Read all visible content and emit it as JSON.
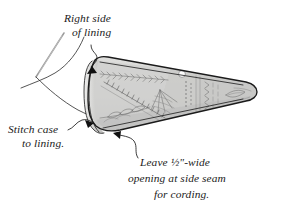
{
  "figure": {
    "background_color": "#ffffff",
    "ink_color": "#1b1b1b",
    "fabric_fill": "#d8d8d6",
    "fabric_shade": "#c2c2c0",
    "stitch_color": "#6f6f6f"
  },
  "annotations": [
    {
      "id": "right-side-of-lining",
      "line1": "Right side",
      "line2": "of lining",
      "x": 64,
      "y": 20,
      "points_to": "left folded edge of case"
    },
    {
      "id": "stitch-case-to-lining",
      "line1": "Stitch case",
      "line2": "to lining.",
      "x": 8,
      "y": 132,
      "points_to": "lower left edge of case"
    },
    {
      "id": "leave-opening",
      "line1": "Leave ½\"-wide",
      "line2": "opening at side seam",
      "line3": "for cording.",
      "x": 140,
      "y": 163,
      "points_to": "bottom seam of case"
    }
  ],
  "fraction": {
    "numerator": "1",
    "denominator": "2",
    "unit": "\""
  },
  "objects": [
    {
      "id": "needle",
      "label": "sewing needle",
      "description": "fine straight needle angled from upper area down to the left"
    },
    {
      "id": "thread",
      "label": "thread curve",
      "description": "curved thread line sweeping from lower left up to the case"
    },
    {
      "id": "case",
      "label": "embroidered cone-shaped case",
      "description": "wedge / cone shaped fabric case with decorative embroidery, rounded right tip, folded rolled edge at left"
    },
    {
      "id": "bead",
      "label": "bead accent",
      "description": "small round white bead on the upper area of the case"
    }
  ],
  "embroidery_motifs": [
    "feather stitch",
    "chevron stitch",
    "spider web rose",
    "leaf stitch",
    "chain stitch",
    "seed beads"
  ]
}
